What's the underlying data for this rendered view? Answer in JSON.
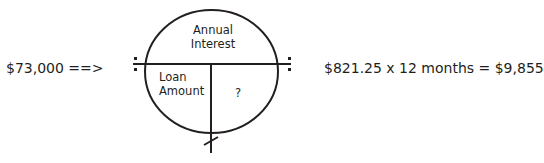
{
  "diagram": {
    "input_value": "$73,000 ==>",
    "equation": "$821.25 x 12 months = $9,855",
    "circle": {
      "top_label": "Annual\nInterest",
      "top_label_lines": [
        "Annual",
        "Interest"
      ],
      "bottom_left_label_lines": [
        "Loan",
        "Amount"
      ],
      "bottom_right_label": "?"
    },
    "symbols": {
      "left_operator": "divide-icon",
      "right_operator": "divide-icon",
      "bottom_operator": "multiply-tick-icon"
    },
    "colors": {
      "stroke": "#231f20",
      "text": "#231f20",
      "background": "#ffffff"
    }
  }
}
